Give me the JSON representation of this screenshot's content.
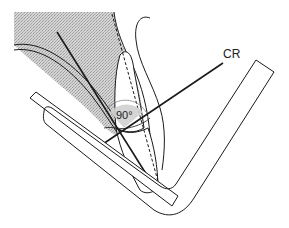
{
  "diagram": {
    "labels": {
      "central_ray": "CR",
      "angle": "90°"
    },
    "colors": {
      "line": "#1a1a1a",
      "tissue_fill": "#c8c8c8",
      "background": "#ffffff"
    }
  }
}
